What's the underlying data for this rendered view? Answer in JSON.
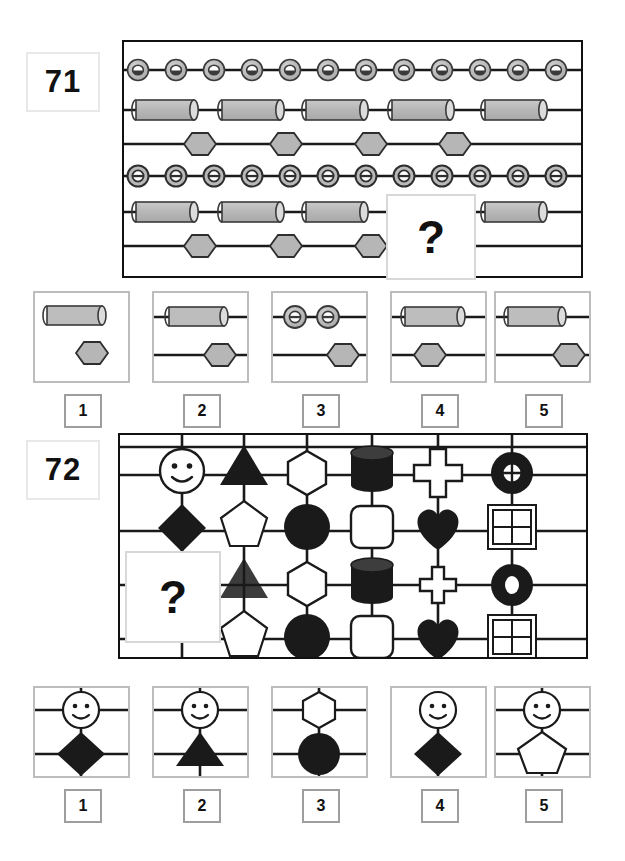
{
  "page": {
    "width": 625,
    "height": 861,
    "background": "#ffffff"
  },
  "colors": {
    "ink": "#111111",
    "grayfill": "#b3b3b3",
    "grayfill_light": "#c9c9c9",
    "panel_border": "#111111",
    "option_border": "#bdbdbd",
    "option_number_border": "#9e9e9e",
    "badge_border": "#e8e8e8",
    "qbox_border": "#d8d8d8",
    "white": "#ffffff",
    "black_shape": "#1a1a1a"
  },
  "puzzles": [
    {
      "id": "puzzle-71",
      "number": "71",
      "question_mark": "?",
      "matrix": {
        "type": "rows-of-repeating-shapes",
        "row_count": 6,
        "rows": [
          {
            "row": 1,
            "shape": "ring3d",
            "count": 12,
            "note": "small beveled rings evenly spaced along line"
          },
          {
            "row": 2,
            "shape": "cylinder",
            "count": 5,
            "note": "horizontal cylinders on line"
          },
          {
            "row": 3,
            "shape": "hexagon",
            "count": 4,
            "note": "hexagons on line"
          },
          {
            "row": 4,
            "shape": "ring2d",
            "count": 12,
            "note": "flat rings evenly spaced along line"
          },
          {
            "row": 5,
            "shape": "cylinder",
            "count": 5,
            "note": "last cylinder partly hidden by question box"
          },
          {
            "row": 6,
            "shape": "hexagon",
            "count": 4,
            "note": "fourth hexagon hidden by question box"
          }
        ]
      },
      "options": [
        {
          "num": "1",
          "contents": "cylinder-and-hexagon-without-lines"
        },
        {
          "num": "2",
          "contents": "cylinder-on-line-and-hexagon-on-line-centered"
        },
        {
          "num": "3",
          "contents": "two-rings-on-line-and-hexagon-on-line"
        },
        {
          "num": "4",
          "contents": "cylinder-on-line-and-hexagon-on-line-left"
        },
        {
          "num": "5",
          "contents": "cylinder-on-line-and-hexagon-on-line-right"
        }
      ]
    },
    {
      "id": "puzzle-72",
      "number": "72",
      "question_mark": "?",
      "matrix": {
        "type": "grid-of-shapes-at-intersections",
        "columns": 6,
        "rows": 4,
        "column_shapes": [
          "smiley / diamond",
          "triangle / pentagon",
          "hexagon / circle",
          "cylinder / rounded-square",
          "cross / heart",
          "donut / window-square"
        ],
        "cells": [
          [
            "smiley",
            "triangle",
            "hexagon",
            "cylinder",
            "cross",
            "donut"
          ],
          [
            "diamond",
            "pentagon",
            "circle",
            "roundsq",
            "heart",
            "window"
          ],
          [
            "missing",
            "triangle",
            "hexagon",
            "cylinder",
            "cross",
            "donut"
          ],
          [
            "missing",
            "pentagon",
            "circle",
            "roundsq",
            "heart",
            "window"
          ]
        ]
      },
      "options": [
        {
          "num": "1",
          "contents": "smiley-above-diamond-with-both-lines"
        },
        {
          "num": "2",
          "contents": "smiley-above-triangle-with-both-lines"
        },
        {
          "num": "3",
          "contents": "hexagon-above-circle-with-both-lines"
        },
        {
          "num": "4",
          "contents": "smiley-above-diamond-no-lines"
        },
        {
          "num": "5",
          "contents": "smiley-above-pentagon-with-both-lines"
        }
      ]
    }
  ]
}
